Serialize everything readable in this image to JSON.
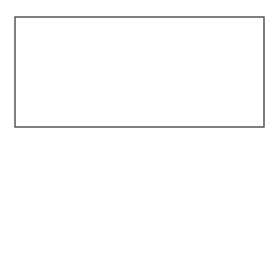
{
  "panel": {
    "letter": "A"
  },
  "labels": {
    "excretory_duct_line1": "Excretory",
    "excretory_duct_line2": "duct",
    "acinar_line1": "Acinar",
    "acinar_line2": "components"
  },
  "colors": {
    "cell_fill": "#e6e6e6",
    "cell_stroke": "#8a8a8a",
    "nucleus": "#111111",
    "border": "#555555",
    "pointer_line": "#222222"
  }
}
